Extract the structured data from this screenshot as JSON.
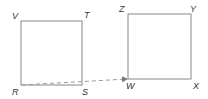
{
  "diagram": {
    "square_rstv": {
      "labels": {
        "top_left": "V",
        "top_right": "T",
        "bottom_left": "R",
        "bottom_right": "S"
      }
    },
    "square_wxyz": {
      "labels": {
        "top_left": "Z",
        "top_right": "Y",
        "bottom_left": "W",
        "bottom_right": "X"
      }
    },
    "arrow": {
      "from": "R",
      "to": "W",
      "style": "dashed"
    },
    "colors": {
      "stroke": "#888888",
      "arrow": "#999999",
      "text": "#333333"
    }
  }
}
